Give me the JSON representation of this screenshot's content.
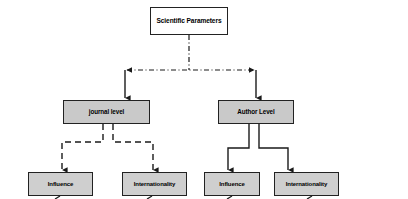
{
  "diagram": {
    "type": "flowchart",
    "background_color": "#ffffff",
    "palette": {
      "root_fill": "#ffffff",
      "level_fill": "#c9c9c9",
      "leaf_fill": "#cfcfcf",
      "border": "#222222",
      "connector": "#1a1a1a"
    },
    "nodes": {
      "root": {
        "label": "Scientific Parameters",
        "x": 150,
        "y": 7,
        "w": 78,
        "h": 28,
        "fill": "#ffffff"
      },
      "level_journal": {
        "label": "journal level",
        "x": 63,
        "y": 100,
        "w": 87,
        "h": 24,
        "fill": "#c9c9c9"
      },
      "level_author": {
        "label": "Author Level",
        "x": 218,
        "y": 100,
        "w": 76,
        "h": 24,
        "fill": "#c9c9c9"
      },
      "journal_influence": {
        "label": "Influence",
        "x": 28,
        "y": 172,
        "w": 65,
        "h": 24,
        "fill": "#cfcfcf"
      },
      "journal_internationality": {
        "label": "Internationality",
        "x": 122,
        "y": 172,
        "w": 65,
        "h": 24,
        "fill": "#cfcfcf"
      },
      "author_influence": {
        "label": "Influence",
        "x": 204,
        "y": 172,
        "w": 56,
        "h": 24,
        "fill": "#cfcfcf"
      },
      "author_internationality": {
        "label": "Internationality",
        "x": 274,
        "y": 172,
        "w": 65,
        "h": 24,
        "fill": "#cfcfcf"
      }
    },
    "edges": [
      {
        "name": "root-to-bus",
        "from": "root",
        "to": "distribution-bus",
        "style": "dash-dot",
        "arrow": "none"
      },
      {
        "name": "bus-left-arrow",
        "from": "distribution-bus",
        "to": "journal-drop",
        "style": "dash-dot",
        "arrow": "start"
      },
      {
        "name": "bus-right-arrow",
        "from": "distribution-bus",
        "to": "author-drop",
        "style": "dash-dot",
        "arrow": "end"
      },
      {
        "name": "bus-to-journal-level",
        "from": "distribution-bus",
        "to": "level_journal",
        "style": "solid",
        "arrow": "end"
      },
      {
        "name": "bus-to-author-level",
        "from": "distribution-bus",
        "to": "level_author",
        "style": "solid",
        "arrow": "end"
      },
      {
        "name": "journal-to-influence",
        "from": "level_journal",
        "to": "journal_influence",
        "style": "dashed",
        "arrow": "end"
      },
      {
        "name": "journal-to-internationality",
        "from": "level_journal",
        "to": "journal_internationality",
        "style": "dashed",
        "arrow": "end"
      },
      {
        "name": "author-to-influence",
        "from": "level_author",
        "to": "author_influence",
        "style": "solid",
        "arrow": "end"
      },
      {
        "name": "author-to-internationality",
        "from": "level_author",
        "to": "author_internationality",
        "style": "solid",
        "arrow": "end"
      },
      {
        "name": "journal-influence-stub",
        "from": "journal_influence",
        "to": "offscreen",
        "style": "solid",
        "arrow": "none"
      },
      {
        "name": "journal-internationality-stub",
        "from": "journal_internationality",
        "to": "offscreen",
        "style": "solid",
        "arrow": "none"
      },
      {
        "name": "author-influence-stub",
        "from": "author_influence",
        "to": "offscreen",
        "style": "solid",
        "arrow": "none"
      },
      {
        "name": "author-internationality-stub",
        "from": "author_internationality",
        "to": "offscreen",
        "style": "solid",
        "arrow": "none"
      }
    ]
  }
}
